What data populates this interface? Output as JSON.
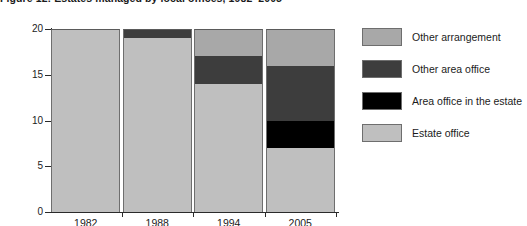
{
  "figure": {
    "title": "Figure 12: Estates managed by local offices, 1982–2005"
  },
  "axes": {
    "y_title": "Number of estates",
    "y_ticks": [
      "0",
      "5",
      "10",
      "15",
      "20"
    ],
    "x_ticks": [
      "1982",
      "1988",
      "1994",
      "2005"
    ]
  },
  "legend": {
    "items": [
      {
        "label": "Other arrangement",
        "color": "#a8a8a8"
      },
      {
        "label": "Other area office",
        "color": "#3d3d3d"
      },
      {
        "label": "Area office in the estate",
        "color": "#000000"
      },
      {
        "label": "Estate office",
        "color": "#bfbfbf"
      }
    ]
  },
  "chart_data": {
    "type": "bar",
    "title": "Figure 12: Estates managed by local offices, 1982–2005",
    "xlabel": "",
    "ylabel": "Number of estates",
    "ylim": [
      0,
      20
    ],
    "yticks": [
      0,
      5,
      10,
      15,
      20
    ],
    "grid": false,
    "stacked": true,
    "legend_position": "right",
    "categories": [
      "1982",
      "1988",
      "1994",
      "2005"
    ],
    "series": [
      {
        "name": "Estate office",
        "color": "#bfbfbf",
        "values": [
          20,
          19,
          14,
          7
        ]
      },
      {
        "name": "Area office in the estate",
        "color": "#000000",
        "values": [
          0,
          0,
          0,
          3
        ]
      },
      {
        "name": "Other area office",
        "color": "#3d3d3d",
        "values": [
          0,
          1,
          3,
          6
        ]
      },
      {
        "name": "Other arrangement",
        "color": "#a8a8a8",
        "values": [
          0,
          0,
          3,
          4
        ]
      }
    ],
    "totals": [
      20,
      20,
      20,
      20
    ]
  }
}
